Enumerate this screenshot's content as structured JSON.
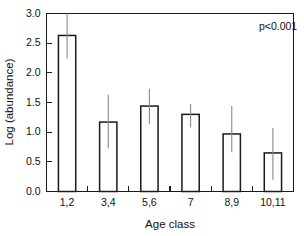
{
  "chart_data": {
    "type": "bar",
    "title": "",
    "xlabel": "Age class",
    "ylabel": "Log (abundance)",
    "categories": [
      "1,2",
      "3,4",
      "5,6",
      "7",
      "8,9",
      "10,11"
    ],
    "values": [
      2.63,
      1.17,
      1.44,
      1.3,
      0.97,
      0.65
    ],
    "error_upper": [
      3.0,
      1.63,
      1.73,
      1.47,
      1.44,
      1.07
    ],
    "error_lower": [
      2.24,
      0.73,
      1.14,
      1.08,
      0.66,
      0.2
    ],
    "ylim": [
      0.0,
      3.0
    ],
    "ytick_labels": [
      "0.0",
      "0.5",
      "1.0",
      "1.5",
      "2.0",
      "2.5",
      "3.0"
    ],
    "ytick_values": [
      0.0,
      0.5,
      1.0,
      1.5,
      2.0,
      2.5,
      3.0
    ],
    "grid": false,
    "legend": null,
    "annotations": [
      {
        "text": "p<0.001",
        "x": 0.86,
        "y": 2.72
      }
    ],
    "colors": {
      "bar_fill": "#ffffff",
      "bar_stroke": "#1a1a1a",
      "error_bar": "#8a8a8a",
      "axis": "#1a1a1a",
      "text": "#111111",
      "background": "#ffffff"
    }
  }
}
